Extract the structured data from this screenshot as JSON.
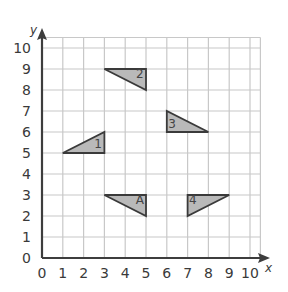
{
  "diagram": {
    "type": "coordinate-grid",
    "x_axis": {
      "label": "x",
      "ticks": [
        "0",
        "1",
        "2",
        "3",
        "4",
        "5",
        "6",
        "7",
        "8",
        "9",
        "10"
      ],
      "min": 0,
      "max": 10
    },
    "y_axis": {
      "label": "y",
      "ticks": [
        "0",
        "1",
        "2",
        "3",
        "4",
        "5",
        "6",
        "7",
        "8",
        "9",
        "10"
      ],
      "min": 0,
      "max": 10
    },
    "grid": {
      "extent": 10.5,
      "color": "#c8c8c8"
    },
    "colors": {
      "axis": "#3d3d3d",
      "triangle_fill": "#b9b9b9",
      "triangle_stroke": "#3a3a3a"
    },
    "triangles": [
      {
        "label": "1",
        "vertices": [
          [
            1,
            5
          ],
          [
            3,
            5
          ],
          [
            3,
            6
          ]
        ],
        "label_pos": [
          2.7,
          5.25
        ]
      },
      {
        "label": "2",
        "vertices": [
          [
            3,
            9
          ],
          [
            5,
            9
          ],
          [
            5,
            8
          ]
        ],
        "label_pos": [
          4.7,
          8.55
        ]
      },
      {
        "label": "3",
        "vertices": [
          [
            6,
            7
          ],
          [
            6,
            6
          ],
          [
            8,
            6
          ]
        ],
        "label_pos": [
          6.25,
          6.2
        ]
      },
      {
        "label": "A",
        "vertices": [
          [
            3,
            3
          ],
          [
            5,
            3
          ],
          [
            5,
            2
          ]
        ],
        "label_pos": [
          4.7,
          2.55
        ]
      },
      {
        "label": "4",
        "vertices": [
          [
            7,
            3
          ],
          [
            9,
            3
          ],
          [
            7,
            2
          ]
        ],
        "label_pos": [
          7.25,
          2.55
        ]
      }
    ]
  }
}
